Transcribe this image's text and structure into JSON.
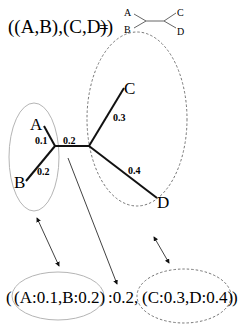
{
  "top": {
    "notation": "((A,B),(C,D))",
    "equals": "=",
    "mini_tree": {
      "a": "A",
      "b": "B",
      "c": "C",
      "d": "D"
    }
  },
  "tree": {
    "leaves": {
      "a": "A",
      "b": "B",
      "c": "C",
      "d": "D"
    },
    "branch_lengths": {
      "a": "0.1",
      "b": "0.2",
      "internal": "0.2",
      "c": "0.3",
      "d": "0.4"
    }
  },
  "newick": {
    "open": "(",
    "left_group": "(A:0.1,B:0.2)",
    "middle": ":0.2,",
    "right_group": "(C:0.3,D:0.4)",
    "close": ")"
  },
  "colors": {
    "line": "#111111",
    "left_ellipse": "#b5b5b5",
    "right_ellipse": "#666666"
  }
}
